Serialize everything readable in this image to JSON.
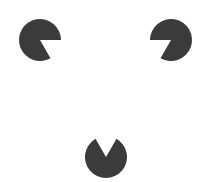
{
  "figure": {
    "background": "#ffffff",
    "fill": "#3b3b3b",
    "inducers": [
      {
        "name": "top-left",
        "cx": 40,
        "cy": 40,
        "r": 21,
        "gap_start_deg": 0,
        "gap_end_deg": 60
      },
      {
        "name": "top-right",
        "cx": 171,
        "cy": 40,
        "r": 21,
        "gap_start_deg": 120,
        "gap_end_deg": 180
      },
      {
        "name": "bottom",
        "cx": 106,
        "cy": 157,
        "r": 21,
        "gap_start_deg": 240,
        "gap_end_deg": 300
      }
    ]
  }
}
